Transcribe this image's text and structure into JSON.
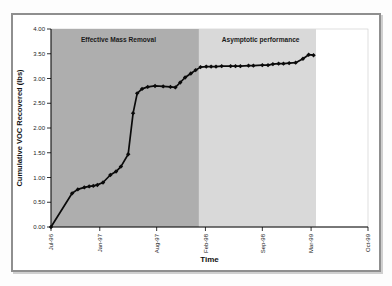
{
  "figure": {
    "background": "#ffffff",
    "frame_color": "#8f8f8f"
  },
  "chart_data": {
    "type": "line",
    "title": "",
    "xlabel": "Time",
    "ylabel": "Cumulative VOC Recovered (lbs)",
    "xlim": [
      0,
      39
    ],
    "ylim": [
      0,
      4
    ],
    "grid": false,
    "legend": false,
    "x_unit_note": "months after Jul-96",
    "x_ticks": [
      {
        "m": 0,
        "label": "Jul-96"
      },
      {
        "m": 6,
        "label": "Jan-97"
      },
      {
        "m": 13,
        "label": "Aug-97"
      },
      {
        "m": 19,
        "label": "Feb-98"
      },
      {
        "m": 26,
        "label": "Sep-98"
      },
      {
        "m": 32,
        "label": "Mar-99"
      },
      {
        "m": 39,
        "label": "Oct-99"
      }
    ],
    "y_ticks": [
      {
        "v": 0.0,
        "label": "0.00"
      },
      {
        "v": 0.5,
        "label": "0.50"
      },
      {
        "v": 1.0,
        "label": "1.00"
      },
      {
        "v": 1.5,
        "label": "1.50"
      },
      {
        "v": 2.0,
        "label": "2.00"
      },
      {
        "v": 2.5,
        "label": "2.50"
      },
      {
        "v": 3.0,
        "label": "3.00"
      },
      {
        "v": 3.5,
        "label": "3.50"
      },
      {
        "v": 4.0,
        "label": "4.00"
      }
    ],
    "regions": [
      {
        "label": "Effective Mass Removal",
        "x0": 0,
        "x1": 18.2,
        "color": "#aeaeae",
        "label_x": 8.3,
        "label_y": 3.77
      },
      {
        "label": "Asymptotic performance",
        "x0": 18.2,
        "x1": 32.6,
        "color": "#d9d9d9",
        "label_x": 25.8,
        "label_y": 3.77
      }
    ],
    "series": [
      {
        "name": "Cumulative VOC Recovered",
        "color": "#0a0a0a",
        "marker": "diamond",
        "points": [
          [
            0,
            0.0
          ],
          [
            2.6,
            0.68
          ],
          [
            3.3,
            0.76
          ],
          [
            4.1,
            0.8
          ],
          [
            4.7,
            0.82
          ],
          [
            5.2,
            0.83
          ],
          [
            5.7,
            0.85
          ],
          [
            6.4,
            0.9
          ],
          [
            7.3,
            1.05
          ],
          [
            8.0,
            1.12
          ],
          [
            8.6,
            1.22
          ],
          [
            9.5,
            1.47
          ],
          [
            10.1,
            2.3
          ],
          [
            10.6,
            2.7
          ],
          [
            11.2,
            2.79
          ],
          [
            11.9,
            2.83
          ],
          [
            12.8,
            2.85
          ],
          [
            13.8,
            2.84
          ],
          [
            14.7,
            2.83
          ],
          [
            15.3,
            2.82
          ],
          [
            15.9,
            2.92
          ],
          [
            16.5,
            3.02
          ],
          [
            17.2,
            3.1
          ],
          [
            17.8,
            3.17
          ],
          [
            18.4,
            3.23
          ],
          [
            19.1,
            3.24
          ],
          [
            19.7,
            3.24
          ],
          [
            20.3,
            3.24
          ],
          [
            21.0,
            3.25
          ],
          [
            22.1,
            3.25
          ],
          [
            22.7,
            3.25
          ],
          [
            23.3,
            3.25
          ],
          [
            24.3,
            3.26
          ],
          [
            24.9,
            3.26
          ],
          [
            26.0,
            3.27
          ],
          [
            26.7,
            3.27
          ],
          [
            27.3,
            3.29
          ],
          [
            28.0,
            3.3
          ],
          [
            28.6,
            3.3
          ],
          [
            29.3,
            3.31
          ],
          [
            30.1,
            3.32
          ],
          [
            31.0,
            3.4
          ],
          [
            31.7,
            3.48
          ],
          [
            32.3,
            3.47
          ]
        ]
      }
    ]
  }
}
